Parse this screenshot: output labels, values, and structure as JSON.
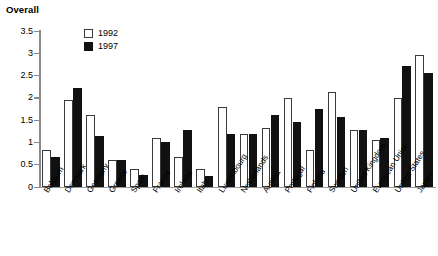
{
  "chart_data": {
    "type": "bar",
    "title": "Overall",
    "xlabel": "",
    "ylabel": "",
    "ylim": [
      0,
      3.5
    ],
    "yticks": [
      "0",
      "0.5",
      "1",
      "1.5",
      "2",
      "2.5",
      "3",
      "3.5"
    ],
    "grid": false,
    "legend_position": "top-left-inside",
    "categories": [
      "Belgium",
      "Denmark",
      "Germany",
      "Greece",
      "Spain",
      "France",
      "Ireland",
      "Italy",
      "Luxembourg",
      "Netherlands",
      "Austria",
      "Portugal",
      "Finland",
      "Sweden",
      "United Kingdom",
      "European Union",
      "United States",
      "Japan"
    ],
    "series": [
      {
        "name": "1992",
        "color": "#ffffff",
        "values": [
          0.83,
          1.95,
          1.62,
          0.61,
          0.4,
          1.1,
          0.67,
          0.41,
          1.79,
          1.18,
          1.33,
          2.0,
          0.84,
          2.14,
          1.28,
          1.05,
          2.0,
          2.96
        ]
      },
      {
        "name": "1997",
        "color": "#111111",
        "values": [
          0.68,
          2.23,
          1.15,
          0.61,
          0.28,
          1.0,
          1.27,
          0.25,
          1.2,
          1.2,
          1.62,
          1.45,
          1.75,
          1.56,
          1.27,
          1.1,
          2.72,
          2.55
        ]
      }
    ]
  }
}
